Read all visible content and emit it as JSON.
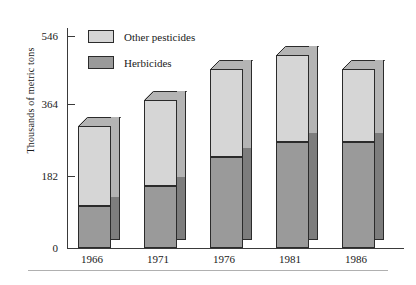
{
  "chart_data": {
    "type": "bar",
    "subtype": "stacked-3d-column",
    "title": "",
    "subtitle": "",
    "xlabel": "",
    "ylabel": "Thousands of metric tons",
    "categories": [
      "1966",
      "1971",
      "1976",
      "1981",
      "1986"
    ],
    "ylim": [
      0,
      546
    ],
    "yticks": [
      0,
      182,
      364,
      546
    ],
    "ytick_labels": [
      "0",
      "182",
      "364",
      "546"
    ],
    "grid": false,
    "legend_position": "top-left-inside",
    "series": [
      {
        "name": "Herbicides",
        "color": "#9a9a9a",
        "values": [
          109,
          159,
          235,
          273,
          273
        ]
      },
      {
        "name": "Other pesticides",
        "color": "#d6d6d6",
        "values": [
          205,
          223,
          225,
          223,
          187
        ]
      }
    ],
    "totals": [
      314,
      382,
      460,
      496,
      460
    ],
    "annotations": []
  },
  "legend": {
    "items": [
      {
        "label": "Other pesticides",
        "swatch": "light-gray-swatch"
      },
      {
        "label": "Herbicides",
        "swatch": "dark-gray-swatch"
      }
    ]
  },
  "axes": {
    "y_title": "Thousands of metric tons",
    "y_labels": [
      "546",
      "364",
      "182",
      "0"
    ],
    "x_labels": [
      "1966",
      "1971",
      "1976",
      "1981",
      "1986"
    ]
  },
  "colors": {
    "other_pesticides_face": "#d6d6d6",
    "other_pesticides_side": "#b4b4b4",
    "herbicides_face": "#9a9a9a",
    "herbicides_side": "#7d7d7d",
    "outline": "#2b2b2b",
    "axis": "#3a3a3a",
    "rule": "#b0b0b0"
  }
}
